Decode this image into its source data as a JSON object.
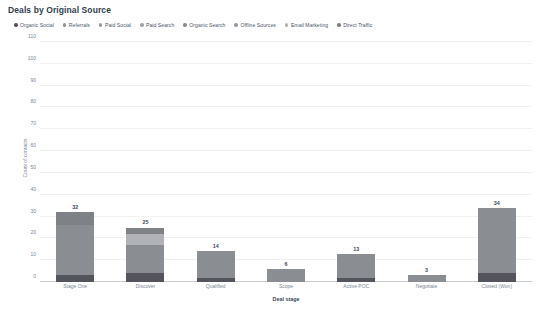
{
  "chart_data": {
    "type": "bar",
    "subtype": "stacked-bar",
    "title": "Deals by Original Source",
    "xlabel": "Deal stage",
    "ylabel": "Count of contacts",
    "ylim": [
      0,
      110
    ],
    "yticks": [
      0,
      10,
      20,
      30,
      40,
      50,
      60,
      70,
      80,
      90,
      100,
      110
    ],
    "grid": true,
    "legend_position": "top-left",
    "categories": [
      "Stage One",
      "Discover",
      "Qualified",
      "Scope",
      "Active POC",
      "Negotiate",
      "Closed (Won)"
    ],
    "totals": [
      32,
      25,
      14,
      6,
      13,
      3,
      34
    ],
    "series": [
      {
        "name": "Organic Social",
        "color": "#53545c",
        "values": [
          3,
          4,
          2,
          0,
          2,
          0,
          4
        ]
      },
      {
        "name": "Referrals",
        "color": "#8f9296",
        "values": [
          0,
          0,
          0,
          0,
          0,
          0,
          0
        ]
      },
      {
        "name": "Paid Social",
        "color": "#97999d",
        "values": [
          0,
          0,
          0,
          0,
          0,
          0,
          0
        ]
      },
      {
        "name": "Paid Search",
        "color": "#a2a4a8",
        "values": [
          0,
          0,
          0,
          0,
          0,
          0,
          0
        ]
      },
      {
        "name": "Organic Search",
        "color": "#8a8d91",
        "values": [
          23,
          13,
          12,
          6,
          11,
          3,
          30
        ]
      },
      {
        "name": "Offline Sources",
        "color": "#989a9e",
        "values": [
          0,
          0,
          0,
          0,
          0,
          0,
          0
        ]
      },
      {
        "name": "Email Marketing",
        "color": "#b0b2b6",
        "values": [
          0,
          5,
          0,
          0,
          0,
          0,
          0
        ]
      },
      {
        "name": "Direct Traffic",
        "color": "#7e8186",
        "values": [
          6,
          3,
          0,
          0,
          0,
          0,
          0
        ]
      }
    ]
  },
  "legend": {
    "items": [
      {
        "label": "Organic Social",
        "color": "#53545c"
      },
      {
        "label": "Referrals",
        "color": "#8f9296"
      },
      {
        "label": "Paid Social",
        "color": "#97999d"
      },
      {
        "label": "Paid Search",
        "color": "#a2a4a8"
      },
      {
        "label": "Organic Search",
        "color": "#8a8d91"
      },
      {
        "label": "Offline Sources",
        "color": "#989a9e"
      },
      {
        "label": "Email Marketing",
        "color": "#b0b2b6"
      },
      {
        "label": "Direct Traffic",
        "color": "#7e8186"
      }
    ]
  }
}
